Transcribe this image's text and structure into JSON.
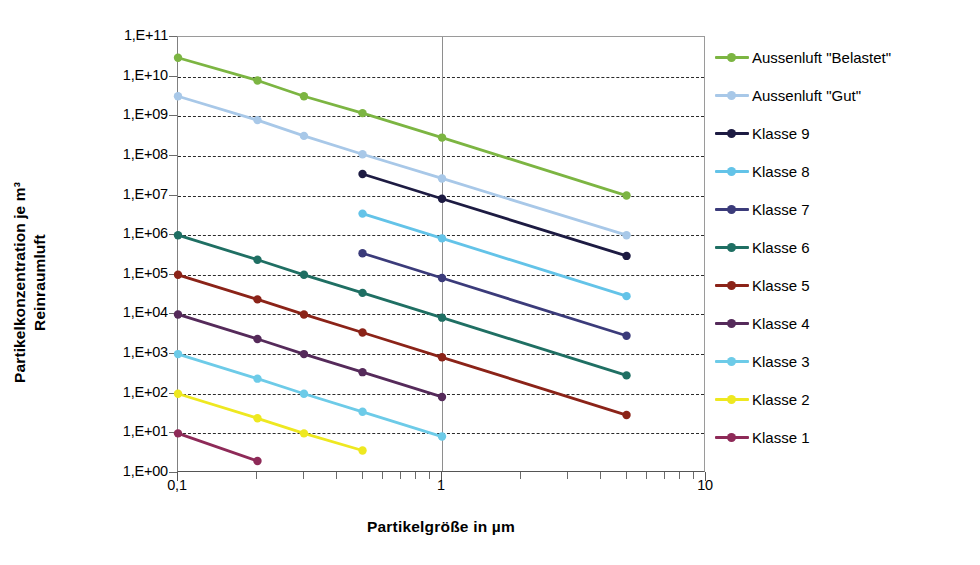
{
  "chart_data": {
    "type": "line",
    "title": "",
    "xlabel": "Partikelgröße  in µm",
    "ylabel": "Partikelkonzentration je m³ Reinraumluft",
    "xscale": "log",
    "yscale": "log",
    "xlim": [
      0.1,
      10
    ],
    "ylim": [
      1,
      100000000000.0
    ],
    "grid": "horizontal-dashed + vertical-solid",
    "legend_position": "right",
    "x_tick_labels": [
      "0,1",
      "1",
      "10"
    ],
    "x_tick_values": [
      0.1,
      1,
      10
    ],
    "y_tick_labels": [
      "1,E+11",
      "1,E+10",
      "1,E+09",
      "1,E+08",
      "1,E+07",
      "1,E+06",
      "1,E+05",
      "1,E+04",
      "1,E+03",
      "1,E+02",
      "1,E+01",
      "1,E+00"
    ],
    "y_tick_values": [
      100000000000.0,
      10000000000.0,
      1000000000.0,
      100000000.0,
      10000000.0,
      1000000.0,
      100000.0,
      10000.0,
      1000.0,
      100.0,
      10.0,
      1.0
    ],
    "series": [
      {
        "name": "Aussenluft \"Belastet\"",
        "color": "#7cb542",
        "x": [
          0.1,
          0.2,
          0.3,
          0.5,
          1,
          5
        ],
        "y": [
          30000000000.0,
          8000000000.0,
          3200000000.0,
          1200000000.0,
          290000000.0,
          10000000.0
        ]
      },
      {
        "name": "Aussenluft \"Gut\"",
        "color": "#a8c8e8",
        "x": [
          0.1,
          0.2,
          0.3,
          0.5,
          1,
          5
        ],
        "y": [
          3200000000.0,
          800000000.0,
          320000000.0,
          110000000.0,
          27000000.0,
          1000000.0
        ]
      },
      {
        "name": "Klasse 9",
        "color": "#1d1b42",
        "x": [
          0.5,
          1,
          5
        ],
        "y": [
          35000000.0,
          8300000.0,
          300000.0
        ]
      },
      {
        "name": "Klasse 8",
        "color": "#63c3e8",
        "x": [
          0.5,
          1,
          5
        ],
        "y": [
          3500000.0,
          830000.0,
          29000.0
        ]
      },
      {
        "name": "Klasse 7",
        "color": "#3b3b7a",
        "x": [
          0.5,
          1,
          5
        ],
        "y": [
          350000.0,
          83000.0,
          2900.0
        ]
      },
      {
        "name": "Klasse 6",
        "color": "#1f6f63",
        "x": [
          0.1,
          0.2,
          0.3,
          0.5,
          1,
          5
        ],
        "y": [
          1000000.0,
          240000.0,
          100000.0,
          35000.0,
          8300.0,
          290.0
        ]
      },
      {
        "name": "Klasse 5",
        "color": "#8b2318",
        "x": [
          0.1,
          0.2,
          0.3,
          0.5,
          1,
          5
        ],
        "y": [
          100000.0,
          24000.0,
          10000.0,
          3500.0,
          830.0,
          29.0
        ]
      },
      {
        "name": "Klasse 4",
        "color": "#552a5a",
        "x": [
          0.1,
          0.2,
          0.3,
          0.5,
          1
        ],
        "y": [
          10000.0,
          2400.0,
          1000.0,
          350.0,
          83.0
        ]
      },
      {
        "name": "Klasse 3",
        "color": "#6dcbe8",
        "x": [
          0.1,
          0.2,
          0.3,
          0.5,
          1
        ],
        "y": [
          1000.0,
          240.0,
          100.0,
          35.0,
          8.3
        ]
      },
      {
        "name": "Klasse 2",
        "color": "#eee820",
        "x": [
          0.1,
          0.2,
          0.3,
          0.5
        ],
        "y": [
          100.0,
          24.0,
          10.0,
          3.7
        ]
      },
      {
        "name": "Klasse 1",
        "color": "#8e2a58",
        "x": [
          0.1,
          0.2
        ],
        "y": [
          10.0,
          2.0
        ]
      }
    ]
  },
  "axes": {
    "y_title_line1": "Partikelkonzentration  je m³",
    "y_title_line2": "Reinraumluft",
    "x_title": "Partikelgröße  in µm"
  }
}
